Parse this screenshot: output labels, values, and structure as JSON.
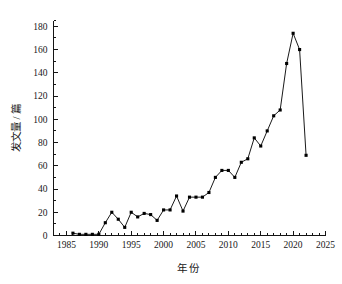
{
  "chart_data": {
    "type": "line",
    "title": "",
    "xlabel": "年  份",
    "ylabel": "发文量 / 篇",
    "xlim": [
      1983,
      2025
    ],
    "ylim": [
      0,
      185
    ],
    "grid": false,
    "legend": null,
    "x_ticks": [
      1985,
      1990,
      1995,
      2000,
      2005,
      2010,
      2015,
      2020,
      2025
    ],
    "x_tick_labels": [
      "1985",
      "1990",
      "1995",
      "2000",
      "2005",
      "2010",
      "2015",
      "2020",
      "2025"
    ],
    "x_minor_tick_step": 1,
    "y_ticks": [
      0,
      20,
      40,
      60,
      80,
      100,
      120,
      140,
      160,
      180
    ],
    "y_tick_labels": [
      "0",
      "20",
      "40",
      "60",
      "80",
      "100",
      "120",
      "140",
      "160",
      "180"
    ],
    "y_minor_tick_step": 10,
    "marker": "square",
    "marker_color": "#000000",
    "line_color": "#000000",
    "x": [
      1986,
      1987,
      1988,
      1989,
      1990,
      1991,
      1992,
      1993,
      1994,
      1995,
      1996,
      1997,
      1998,
      1999,
      2000,
      2001,
      2002,
      2003,
      2004,
      2005,
      2006,
      2007,
      2008,
      2009,
      2010,
      2011,
      2012,
      2013,
      2014,
      2015,
      2016,
      2017,
      2018,
      2019,
      2020,
      2021,
      2022
    ],
    "values": [
      2,
      1,
      1,
      1,
      1,
      11,
      20,
      14,
      7,
      20,
      16,
      19,
      18,
      13,
      22,
      22,
      34,
      21,
      33,
      33,
      33,
      37,
      50,
      56,
      56,
      50,
      63,
      66,
      84,
      77,
      90,
      103,
      108,
      148,
      174,
      160,
      69
    ],
    "series": [
      {
        "name": "发文量",
        "values": [
          2,
          1,
          1,
          1,
          1,
          11,
          20,
          14,
          7,
          20,
          16,
          19,
          18,
          13,
          22,
          22,
          34,
          21,
          33,
          33,
          33,
          37,
          50,
          56,
          56,
          50,
          63,
          66,
          84,
          77,
          90,
          103,
          108,
          148,
          174,
          160,
          69
        ]
      }
    ],
    "peak": {
      "x": 2020,
      "y": 174
    },
    "last": {
      "x": 2022,
      "y": 69
    }
  }
}
